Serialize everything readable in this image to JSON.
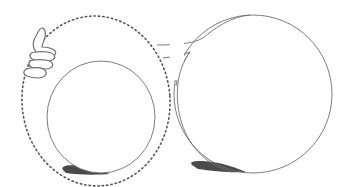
{
  "illustration": {
    "description": "Line drawing: dotted outline circle with a thumbs-up hand, a smaller solid circle inside it, and a large solid circle on the right joined by a neck shape; dark shadows under both solid circles",
    "colors": {
      "background": "#ffffff",
      "line": "#6e6e6e",
      "dotted": "#555555",
      "shadow": "#4a4a4a"
    }
  }
}
